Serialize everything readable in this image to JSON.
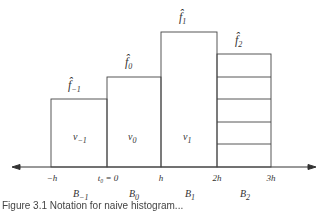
{
  "diagram": {
    "type": "histogram-bins",
    "bins": [
      {
        "density_label": "f̂",
        "density_sub": "−1",
        "volume_label": "ν",
        "volume_sub": "−1",
        "bin_label": "B",
        "bin_sub": "−1"
      },
      {
        "density_label": "f̂",
        "density_sub": "0",
        "volume_label": "ν",
        "volume_sub": "0",
        "bin_label": "B",
        "bin_sub": "0"
      },
      {
        "density_label": "f̂",
        "density_sub": "1",
        "volume_label": "ν",
        "volume_sub": "1",
        "bin_label": "B",
        "bin_sub": "1"
      },
      {
        "density_label": "f̂",
        "density_sub": "2",
        "volume_label": "",
        "volume_sub": "",
        "bin_label": "B",
        "bin_sub": "2"
      }
    ],
    "ticks": [
      "−h",
      "t₀ = 0",
      "h",
      "2h",
      "3h"
    ],
    "caption": "Figure 3.1  Notation for naive histogram..."
  }
}
